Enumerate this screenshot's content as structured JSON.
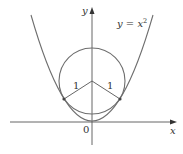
{
  "figure": {
    "type": "diagram",
    "curve_label": {
      "base": "y = x",
      "exponent": "2"
    },
    "x_axis_label": "x",
    "y_axis_label": "y",
    "origin_label": "0",
    "radius_labels": [
      "1",
      "1"
    ],
    "colors": {
      "curve": "#6e6e6e",
      "axis": "#555555",
      "text": "#333333",
      "point": "#444444"
    }
  }
}
